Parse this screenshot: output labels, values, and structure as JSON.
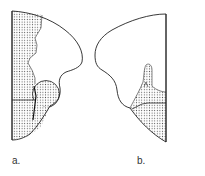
{
  "figures": [
    {
      "id": "a",
      "label": "a.",
      "description": "Left-side section outline with stippled region along left margin, a circular stippled nodule and a stippled lower region"
    },
    {
      "id": "b",
      "label": "b.",
      "description": "Right-side section outline with stippled projecting region and stippled lower region along right margin"
    }
  ],
  "colors": {
    "stroke": "#222222",
    "stipple": "#555555",
    "background": "#ffffff"
  }
}
